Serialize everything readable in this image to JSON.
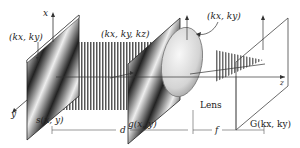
{
  "diagram": {
    "type": "optical-fourier-transform-setup",
    "colors": {
      "line": "#333333",
      "plate_dark": "#222222",
      "plate_light": "#eeeeee",
      "lens": "#dcdcdc"
    },
    "labels": {
      "x_axis": "x",
      "y_axis": "y",
      "z_axis": "z",
      "input_wavevector": "(kx, ky)",
      "plane_wave": "(kx, ky, kz)",
      "lens_wavevector": "(kx, ky)",
      "source_plane": "s(x, y)",
      "object_plane": "g(x, y)",
      "lens": "Lens",
      "fourier_plane": "G(kx, ky)",
      "distance_d": "d",
      "distance_f": "f"
    },
    "components": [
      {
        "name": "source-plate",
        "label": "s(x, y)"
      },
      {
        "name": "object-plate",
        "label": "g(x, y)"
      },
      {
        "name": "lens",
        "label": "Lens"
      },
      {
        "name": "fourier-plane",
        "label": "G(kx, ky)"
      }
    ]
  }
}
